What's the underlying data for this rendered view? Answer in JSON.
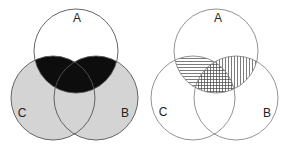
{
  "figures": [
    {
      "id": "left",
      "description": "Shaded Venn diagram: A intersect (B union C) black; (B union C) minus A gray",
      "labels": {
        "a": "A",
        "b": "B",
        "c": "C"
      },
      "colors": {
        "outline": "#555555",
        "black_region": "#0d0d0d",
        "gray_region": "#d4d4d4"
      },
      "regions": [
        {
          "set": "A ∩ (B ∪ C)",
          "fill": "black"
        },
        {
          "set": "(B ∪ C) − A",
          "fill": "gray"
        },
        {
          "set": "A − (B ∪ C)",
          "fill": "none"
        }
      ]
    },
    {
      "id": "right",
      "description": "Hatched Venn diagram: A∩C horizontal lines, A∩B vertical lines, A∩B∩C crosshatched",
      "labels": {
        "a": "A",
        "b": "B",
        "c": "C"
      },
      "colors": {
        "outline": "#777777",
        "hatch": "#444444"
      },
      "regions": [
        {
          "set": "A ∩ C",
          "fill": "horizontal-hatch"
        },
        {
          "set": "A ∩ B",
          "fill": "vertical-hatch"
        },
        {
          "set": "A ∩ B ∩ C",
          "fill": "crosshatch"
        }
      ]
    }
  ]
}
